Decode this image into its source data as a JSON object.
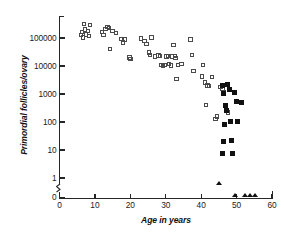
{
  "chart_data": {
    "type": "scatter",
    "title": "",
    "xlabel": "Age in years",
    "ylabel": "Primordial follicles/ovary",
    "xlim": [
      0,
      60
    ],
    "ylim_log": [
      1,
      1000000
    ],
    "y_scale": "log",
    "y_axis_break": true,
    "y_axis_break_note": "axis break between 1 and 0",
    "grid": false,
    "legend_position": "none",
    "x_ticks": [
      0,
      10,
      20,
      30,
      40,
      50,
      60
    ],
    "x_tick_labels": [
      "0",
      "10",
      "20",
      "30",
      "40",
      "50",
      "60"
    ],
    "y_ticks": [
      100000,
      10000,
      1000,
      100,
      10,
      1,
      0
    ],
    "y_tick_labels": [
      "100000",
      "10000",
      "1000",
      "100",
      "10",
      "1",
      "0"
    ],
    "series": [
      {
        "name": "open-square",
        "marker": "open square",
        "color": "#4a4a4a",
        "points": [
          [
            6.0,
            130000
          ],
          [
            6.3,
            160000
          ],
          [
            6.6,
            105000
          ],
          [
            7.0,
            310000
          ],
          [
            7.2,
            200000
          ],
          [
            7.5,
            135000
          ],
          [
            8.0,
            175000
          ],
          [
            8.3,
            120000
          ],
          [
            8.6,
            290000
          ],
          [
            12.0,
            160000
          ],
          [
            12.4,
            130000
          ],
          [
            13.0,
            205000
          ],
          [
            13.6,
            245000
          ],
          [
            14.0,
            230000
          ],
          [
            14.3,
            40000
          ],
          [
            15.0,
            175000
          ],
          [
            16.0,
            150000
          ],
          [
            17.5,
            92000
          ],
          [
            18.0,
            70000
          ],
          [
            18.4,
            88000
          ],
          [
            19.8,
            20000
          ],
          [
            20.1,
            17500
          ],
          [
            23.0,
            95000
          ],
          [
            24.0,
            78000
          ],
          [
            24.6,
            60000
          ],
          [
            25.2,
            30000
          ],
          [
            25.6,
            25000
          ],
          [
            26.0,
            105000
          ],
          [
            27.0,
            22000
          ],
          [
            28.0,
            24000
          ],
          [
            28.4,
            23000
          ],
          [
            28.8,
            11000
          ],
          [
            29.2,
            10500
          ],
          [
            29.6,
            11000
          ],
          [
            30.2,
            22000
          ],
          [
            30.6,
            23000
          ],
          [
            31.0,
            11500
          ],
          [
            31.4,
            10500
          ],
          [
            31.8,
            22000
          ],
          [
            32.2,
            55000
          ],
          [
            32.6,
            23000
          ],
          [
            32.8,
            19000
          ],
          [
            33.0,
            3500
          ],
          [
            33.4,
            11000
          ],
          [
            34.5,
            11500
          ],
          [
            37.0,
            88000
          ],
          [
            37.4,
            25000
          ],
          [
            37.8,
            6500
          ],
          [
            40.2,
            4200
          ],
          [
            40.6,
            11000
          ],
          [
            41.0,
            2600
          ],
          [
            41.4,
            400
          ],
          [
            41.8,
            2000
          ],
          [
            42.2,
            1900
          ],
          [
            43.0,
            4000
          ],
          [
            44.0,
            130
          ],
          [
            44.4,
            155
          ],
          [
            45.5,
            1750
          ],
          [
            46.0,
            1500
          ],
          [
            46.4,
            1200
          ],
          [
            47.5,
            220
          ]
        ]
      },
      {
        "name": "filled-square",
        "marker": "filled square",
        "color": "#111111",
        "points": [
          [
            46.0,
            2000
          ],
          [
            46.4,
            1050
          ],
          [
            47.4,
            2150
          ],
          [
            47.0,
            380
          ],
          [
            47.2,
            250
          ],
          [
            46.6,
            80
          ],
          [
            48.0,
            1450
          ],
          [
            48.2,
            105
          ],
          [
            48.6,
            22
          ],
          [
            48.8,
            7.5
          ],
          [
            46.2,
            20
          ],
          [
            46.0,
            7.8
          ],
          [
            49.4,
            1150
          ],
          [
            50.0,
            540
          ],
          [
            50.2,
            105
          ],
          [
            51.5,
            480
          ]
        ]
      },
      {
        "name": "filled-triangle",
        "marker": "filled triangle",
        "color": "#111111",
        "points_at_zero": [
          49.5,
          52.5,
          53.8,
          55.2
        ],
        "points_below_one": [
          45.0
        ]
      }
    ]
  }
}
